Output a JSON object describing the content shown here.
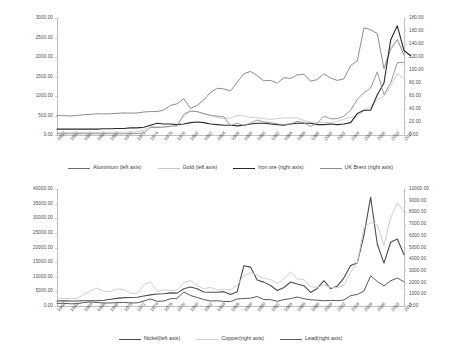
{
  "chart_data": [
    {
      "type": "line",
      "title": "",
      "xlabel": "",
      "ylabel": "",
      "grid": false,
      "legend_position": "bottom",
      "x": [
        1960,
        1961,
        1962,
        1963,
        1964,
        1965,
        1966,
        1967,
        1968,
        1969,
        1970,
        1971,
        1972,
        1973,
        1974,
        1975,
        1976,
        1977,
        1978,
        1979,
        1980,
        1981,
        1982,
        1983,
        1984,
        1985,
        1986,
        1987,
        1988,
        1989,
        1990,
        1991,
        1992,
        1993,
        1994,
        1995,
        1996,
        1997,
        1998,
        1999,
        2000,
        2001,
        2002,
        2003,
        2004,
        2005,
        2006,
        2007,
        2008,
        2009,
        2010,
        2011,
        2012
      ],
      "xtick_labels": [
        "1960",
        "1962",
        "1964",
        "1966",
        "1968",
        "1970",
        "1972",
        "1974",
        "1976",
        "1978",
        "1980",
        "1982",
        "1984",
        "1986",
        "1988",
        "1990",
        "1992",
        "1994",
        "1996",
        "1998",
        "2000",
        "2002",
        "2004",
        "2006",
        "2008",
        "2010",
        "2012"
      ],
      "left_axis": {
        "ticks": [
          "0.00",
          "500.00",
          "1000.00",
          "1500.00",
          "2000.00",
          "2500.00",
          "3000.00"
        ],
        "min": 0,
        "max": 3000
      },
      "right_axis": {
        "ticks": [
          "0.00",
          "20.00",
          "40.00",
          "60.00",
          "80.00",
          "100.00",
          "120.00",
          "140.00",
          "160.00",
          "180.00"
        ],
        "min": 0,
        "max": 180
      },
      "series": [
        {
          "name": "Aluminium (left axis)",
          "axis": "left",
          "color": "#6f6f6f",
          "width": 0.8,
          "values": [
            500,
            495,
            490,
            500,
            520,
            530,
            545,
            540,
            545,
            555,
            565,
            560,
            565,
            590,
            600,
            600,
            640,
            760,
            800,
            935,
            680,
            760,
            900,
            1090,
            1200,
            1180,
            1130,
            1350,
            1570,
            1630,
            1520,
            1390,
            1400,
            1330,
            1470,
            1450,
            1540,
            1560,
            1380,
            1420,
            1570,
            1460,
            1400,
            1440,
            1780,
            1900,
            2750,
            2700,
            2600,
            1700,
            2200,
            2450,
            2050
          ]
        },
        {
          "name": "Gold (left axis)",
          "axis": "left",
          "color": "#c8c8c8",
          "width": 0.9,
          "values": [
            60,
            62,
            63,
            63,
            64,
            65,
            65,
            66,
            70,
            70,
            72,
            75,
            85,
            130,
            220,
            220,
            190,
            215,
            260,
            480,
            610,
            600,
            540,
            510,
            450,
            420,
            440,
            500,
            490,
            450,
            440,
            420,
            400,
            420,
            440,
            440,
            440,
            370,
            330,
            320,
            320,
            320,
            350,
            410,
            450,
            470,
            640,
            730,
            900,
            990,
            1250,
            1570,
            1450
          ]
        },
        {
          "name": "Iron ore (right axis)",
          "axis": "right",
          "color": "#2a2a2a",
          "width": 1.1,
          "values": [
            9,
            9,
            9,
            9,
            9,
            9,
            9,
            9.5,
            9.5,
            10,
            10,
            11,
            11,
            12,
            15,
            18,
            17,
            17,
            16,
            17,
            19,
            20,
            19,
            17,
            16,
            15,
            15,
            14,
            15,
            17,
            18,
            18,
            17,
            16,
            15,
            17,
            18,
            18,
            18,
            16,
            16,
            17,
            16,
            17,
            19,
            33,
            38,
            38,
            62,
            80,
            146,
            168,
            130,
            122
          ]
        },
        {
          "name": "UK Brent (right axis)",
          "axis": "right",
          "color": "#8c8c8c",
          "width": 0.9,
          "values": [
            1.9,
            1.9,
            1.9,
            1.9,
            1.9,
            1.9,
            1.9,
            1.9,
            1.9,
            1.9,
            1.9,
            2.2,
            2.5,
            3.3,
            11.5,
            11.5,
            12.5,
            13.5,
            14,
            32,
            37,
            36,
            33,
            30,
            29,
            28,
            14.5,
            18,
            14.8,
            18,
            23,
            20,
            19,
            17,
            16,
            17,
            21,
            19,
            13,
            18,
            29,
            25,
            25,
            29,
            38,
            55,
            65,
            72,
            97,
            62,
            80,
            111,
            112
          ]
        }
      ]
    },
    {
      "type": "line",
      "title": "",
      "xlabel": "",
      "ylabel": "",
      "grid": false,
      "legend_position": "bottom",
      "x": [
        1960,
        1961,
        1962,
        1963,
        1964,
        1965,
        1966,
        1967,
        1968,
        1969,
        1970,
        1971,
        1972,
        1973,
        1974,
        1975,
        1976,
        1977,
        1978,
        1979,
        1980,
        1981,
        1982,
        1983,
        1984,
        1985,
        1986,
        1987,
        1988,
        1989,
        1990,
        1991,
        1992,
        1993,
        1994,
        1995,
        1996,
        1997,
        1998,
        1999,
        2000,
        2001,
        2002,
        2003,
        2004,
        2005,
        2006,
        2007,
        2008,
        2009,
        2010,
        2011,
        2012
      ],
      "xtick_labels": [
        "1960",
        "1962",
        "1964",
        "1966",
        "1968",
        "1970",
        "1972",
        "1974",
        "1976",
        "1978",
        "1980",
        "1982",
        "1984",
        "1986",
        "1988",
        "1990",
        "1992",
        "1994",
        "1996",
        "1998",
        "2000",
        "2002",
        "2004",
        "2006",
        "2008",
        "2010",
        "2012"
      ],
      "left_axis": {
        "ticks": [
          "0.00",
          "5000.00",
          "10000.00",
          "15000.00",
          "20000.00",
          "25000.00",
          "30000.00",
          "35000.00",
          "40000.00"
        ],
        "min": 0,
        "max": 40000
      },
      "right_axis": {
        "ticks": [
          "0.00",
          "1000.00",
          "2000.00",
          "3000.00",
          "4000.00",
          "5000.00",
          "6000.00",
          "7000.00",
          "8000.00",
          "9000.00",
          "10000.00"
        ],
        "min": 0,
        "max": 10000
      },
      "series": [
        {
          "name": "Nickel(left axis)",
          "axis": "left",
          "color": "#4d4d4d",
          "width": 1.1,
          "values": [
            1730,
            1760,
            1700,
            1720,
            1780,
            1800,
            1800,
            1950,
            2300,
            2600,
            2850,
            2900,
            3000,
            3400,
            3800,
            4100,
            4200,
            4500,
            4400,
            5900,
            6500,
            5900,
            4800,
            4700,
            4700,
            4900,
            3900,
            4870,
            13780,
            13300,
            8860,
            8160,
            7000,
            5290,
            6340,
            8220,
            7500,
            6930,
            4630,
            6000,
            8640,
            5950,
            6770,
            9630,
            13850,
            14740,
            24250,
            37200,
            21110,
            14660,
            21810,
            22900,
            17530
          ]
        },
        {
          "name": "Copper(right axis)",
          "axis": "right",
          "color": "#cfcfcf",
          "width": 1.0,
          "values": [
            680,
            640,
            640,
            640,
            970,
            1290,
            1530,
            1250,
            1240,
            1460,
            1410,
            1080,
            1070,
            1780,
            2060,
            1240,
            1400,
            1310,
            1370,
            1980,
            2180,
            1740,
            1480,
            1590,
            1380,
            1420,
            1370,
            1780,
            2600,
            2850,
            2660,
            2340,
            2280,
            1910,
            2310,
            2930,
            2290,
            2280,
            1650,
            1570,
            1810,
            1580,
            1560,
            1780,
            2870,
            3680,
            6720,
            7120,
            6960,
            5150,
            7530,
            8820,
            7960
          ]
        },
        {
          "name": "Lead(right axis)",
          "axis": "right",
          "color": "#5a5a5a",
          "width": 1.0,
          "values": [
            220,
            230,
            190,
            200,
            290,
            350,
            300,
            260,
            260,
            290,
            310,
            260,
            270,
            420,
            600,
            400,
            420,
            620,
            650,
            1200,
            900,
            730,
            550,
            430,
            450,
            390,
            380,
            600,
            640,
            670,
            810,
            550,
            540,
            400,
            550,
            630,
            770,
            620,
            530,
            500,
            450,
            480,
            450,
            510,
            890,
            980,
            1290,
            2580,
            2090,
            1720,
            2150,
            2400,
            2060
          ]
        }
      ]
    }
  ]
}
